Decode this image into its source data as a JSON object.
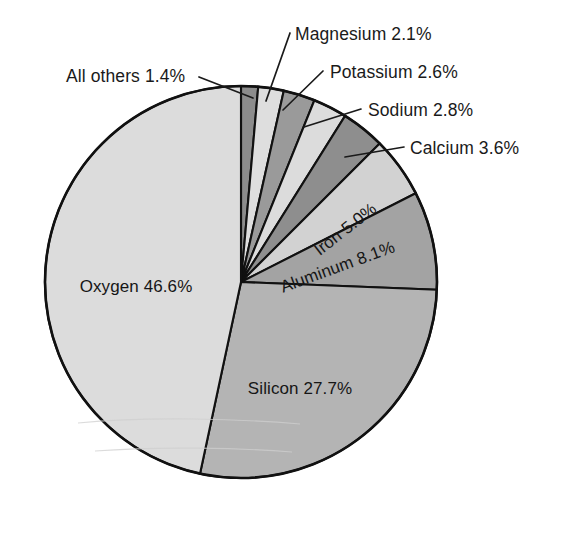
{
  "figure": {
    "kind": "pie-chart",
    "background_color": "#ffffff",
    "outline_color": "#111111",
    "text_color": "#1a1a1a"
  },
  "geometry": {
    "center_x": 241,
    "center_y": 282,
    "radius": 196,
    "start_angle_deg": -90,
    "direction": "clockwise"
  },
  "chart_data": {
    "type": "pie",
    "title": "",
    "subtitle": "",
    "xlabel": "",
    "ylabel": "",
    "grid": false,
    "legend_position": "none",
    "label_format": "{name} {value}%",
    "total": 99.9,
    "categories": [
      "All others",
      "Magnesium",
      "Potassium",
      "Sodium",
      "Calcium",
      "Iron",
      "Aluminum",
      "Silicon",
      "Oxygen"
    ],
    "values": [
      1.4,
      2.1,
      2.6,
      2.8,
      3.6,
      5.0,
      8.1,
      27.7,
      46.6
    ],
    "slices": [
      {
        "name": "All others",
        "value": 1.4,
        "value_text": "1.4%",
        "label": "All others 1.4%",
        "color": "#8c8c8c",
        "label_placement": "callout",
        "callout": {
          "text_x": 66,
          "text_y": 69,
          "anchor": "start",
          "leader": [
            [
              199,
              77
            ],
            [
              253,
              98
            ]
          ]
        }
      },
      {
        "name": "Magnesium",
        "value": 2.1,
        "value_text": "2.1%",
        "label": "Magnesium 2.1%",
        "color": "#dedede",
        "label_placement": "callout",
        "callout": {
          "text_x": 295,
          "text_y": 27,
          "anchor": "start",
          "leader": [
            [
              290,
              33
            ],
            [
              266,
              101
            ]
          ]
        }
      },
      {
        "name": "Potassium",
        "value": 2.6,
        "value_text": "2.6%",
        "label": "Potassium 2.6%",
        "color": "#9a9a9a",
        "label_placement": "callout",
        "callout": {
          "text_x": 330,
          "text_y": 65,
          "anchor": "start",
          "leader": [
            [
              323,
              71
            ],
            [
              283,
              110
            ]
          ]
        }
      },
      {
        "name": "Sodium",
        "value": 2.8,
        "value_text": "2.8%",
        "label": "Sodium 2.8%",
        "color": "#dcdcdc",
        "label_placement": "callout",
        "callout": {
          "text_x": 368,
          "text_y": 103,
          "anchor": "start",
          "leader": [
            [
              361,
              109
            ],
            [
              304,
              127
            ]
          ]
        }
      },
      {
        "name": "Calcium",
        "value": 3.6,
        "value_text": "3.6%",
        "label": "Calcium 3.6%",
        "color": "#8e8e8e",
        "label_placement": "callout",
        "callout": {
          "text_x": 410,
          "text_y": 141,
          "anchor": "start",
          "leader": [
            [
              404,
              147
            ],
            [
              345,
              157
            ]
          ]
        }
      },
      {
        "name": "Iron",
        "value": 5.0,
        "value_text": "5.0%",
        "label": "Iron 5.0%",
        "color": "#d2d2d2",
        "label_placement": "inside-rotated",
        "inside": {
          "x": 346,
          "y": 230,
          "rotate": -38
        }
      },
      {
        "name": "Aluminum",
        "value": 8.1,
        "value_text": "8.1%",
        "label": "Aluminum 8.1%",
        "color": "#a3a3a3",
        "label_placement": "inside-rotated",
        "inside": {
          "x": 338,
          "y": 268,
          "rotate": -20
        }
      },
      {
        "name": "Silicon",
        "value": 27.7,
        "value_text": "27.7%",
        "label": "Silicon 27.7%",
        "color": "#b4b4b4",
        "label_placement": "inside",
        "inside": {
          "x": 300,
          "y": 390,
          "rotate": 0
        }
      },
      {
        "name": "Oxygen",
        "value": 46.6,
        "value_text": "46.6%",
        "label": "Oxygen 46.6%",
        "color": "#dcdcdc",
        "label_placement": "inside",
        "inside": {
          "x": 136,
          "y": 288,
          "rotate": 0
        }
      }
    ]
  }
}
